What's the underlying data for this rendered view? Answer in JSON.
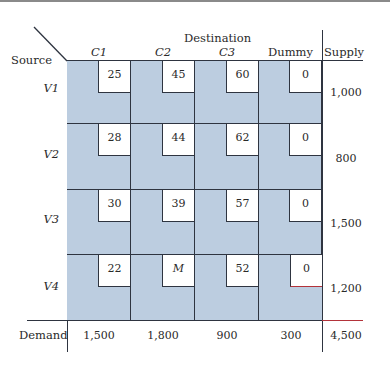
{
  "title": "Destination",
  "corner": {
    "source_label": "Source"
  },
  "columns": [
    {
      "label": "C1"
    },
    {
      "label": "C2"
    },
    {
      "label": "C3"
    },
    {
      "label": "Dummy"
    }
  ],
  "supply_header": "Supply",
  "rows": [
    {
      "label": "V1",
      "costs": [
        "25",
        "45",
        "60",
        "0"
      ],
      "supply": "1,000"
    },
    {
      "label": "V2",
      "costs": [
        "28",
        "44",
        "62",
        "0"
      ],
      "supply": "800"
    },
    {
      "label": "V3",
      "costs": [
        "30",
        "39",
        "57",
        "0"
      ],
      "supply": "1,500"
    },
    {
      "label": "V4",
      "costs": [
        "22",
        "M",
        "52",
        "0"
      ],
      "supply": "1,200"
    }
  ],
  "demand": {
    "label": "Demand",
    "values": [
      "1,500",
      "1,800",
      "900",
      "300"
    ],
    "total": "4,500"
  },
  "colors": {
    "cell_fill": "#bccde0",
    "cost_box": "#ffffff",
    "grid_line": "#2e3440",
    "accent_line": "#b3333a"
  }
}
